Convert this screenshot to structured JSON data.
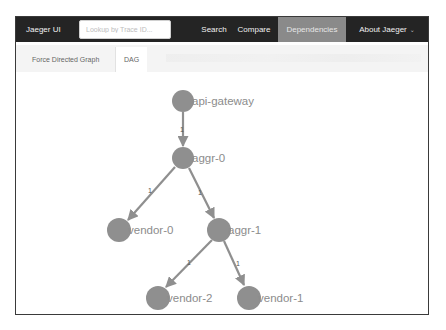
{
  "navbar": {
    "brand": "Jaeger UI",
    "search_placeholder": "Lookup by Trace ID...",
    "items": [
      {
        "label": "Search",
        "active": false
      },
      {
        "label": "Compare",
        "active": false
      },
      {
        "label": "Dependencies",
        "active": true
      },
      {
        "label": "About Jaeger",
        "active": false,
        "dropdown": true
      }
    ],
    "caret_icon": "chevron-down-icon"
  },
  "tabs": [
    {
      "label": "Force Directed Graph",
      "active": false
    },
    {
      "label": "DAG",
      "active": true
    }
  ],
  "graph": {
    "node_color": "#8f8f8f",
    "edge_color": "#8f8f8f",
    "nodes": [
      {
        "id": "api-gateway",
        "label": "api-gateway"
      },
      {
        "id": "aggr-0",
        "label": "aggr-0"
      },
      {
        "id": "vendor-0",
        "label": "vendor-0"
      },
      {
        "id": "aggr-1",
        "label": "aggr-1"
      },
      {
        "id": "vendor-2",
        "label": "vendor-2"
      },
      {
        "id": "vendor-1",
        "label": "vendor-1"
      }
    ],
    "edges": [
      {
        "from": "api-gateway",
        "to": "aggr-0",
        "label": "1"
      },
      {
        "from": "aggr-0",
        "to": "vendor-0",
        "label": "1"
      },
      {
        "from": "aggr-0",
        "to": "aggr-1",
        "label": "1"
      },
      {
        "from": "aggr-1",
        "to": "vendor-2",
        "label": "1"
      },
      {
        "from": "aggr-1",
        "to": "vendor-1",
        "label": "1"
      }
    ]
  },
  "colors": {
    "navbar_bg": "#242424",
    "active_nav_bg": "#8a8a8a",
    "tabbar_bg": "#f4f4f4"
  }
}
